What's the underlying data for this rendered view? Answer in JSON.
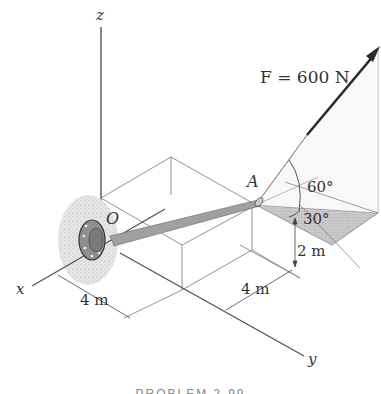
{
  "figure": {
    "axes": {
      "x_label": "x",
      "y_label": "y",
      "z_label": "z"
    },
    "origin_label": "O",
    "point_label": "A",
    "force": {
      "label": "F = 600 N",
      "magnitude": 600,
      "unit": "N"
    },
    "angles": {
      "elevation": "60°",
      "azimuth": "30°"
    },
    "dimensions": {
      "x_dist": "4 m",
      "y_dist": "4 m",
      "z_dist": "2 m"
    },
    "caption": "PROBLEM 2-99"
  },
  "colors": {
    "line": "#555555",
    "arrow": "#2b2b2b",
    "shade": "#c9c9c9",
    "rod": "#9a9a9a"
  }
}
